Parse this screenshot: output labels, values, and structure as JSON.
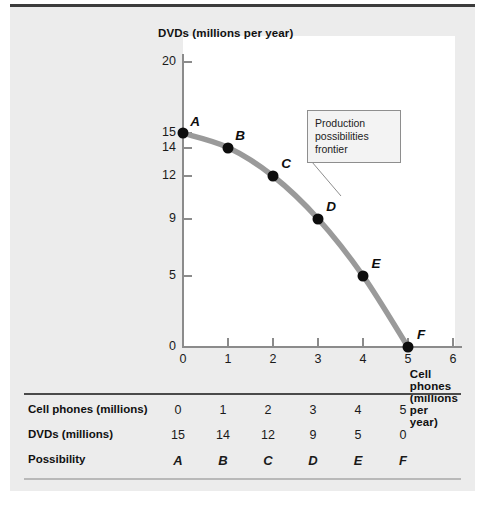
{
  "figure": {
    "plot_bg": "#ffffff",
    "panel_bg": "#ececec",
    "curve_color": "#9a9a9a",
    "point_color": "#0d0d0d",
    "axis_color": "#8b8b8b"
  },
  "callout": {
    "line1": "Production",
    "line2": "possibilities",
    "line3": "frontier"
  },
  "chart_data": {
    "type": "line",
    "title": "",
    "xlabel": "Cell phones (millions per year)",
    "ylabel": "DVDs (millions per year)",
    "xlim": [
      0,
      6
    ],
    "ylim": [
      0,
      20
    ],
    "xticks": [
      "0",
      "1",
      "2",
      "3",
      "4",
      "5",
      "6"
    ],
    "xtick_values": [
      0,
      1,
      2,
      3,
      4,
      5,
      6
    ],
    "yticks": [
      "0",
      "5",
      "9",
      "12",
      "14",
      "15",
      "20"
    ],
    "ytick_values": [
      0,
      5,
      9,
      12,
      14,
      15,
      20
    ],
    "grid": false,
    "legend": "none",
    "annotation": "Production possibilities frontier",
    "x": [
      0,
      1,
      2,
      3,
      4,
      5
    ],
    "values": [
      15,
      14,
      12,
      9,
      5,
      0
    ],
    "point_labels": [
      "A",
      "B",
      "C",
      "D",
      "E",
      "F"
    ],
    "series": [
      {
        "name": "Production possibilities frontier",
        "x": [
          0,
          1,
          2,
          3,
          4,
          5
        ],
        "values": [
          15,
          14,
          12,
          9,
          5,
          0
        ]
      }
    ]
  },
  "table": {
    "rows": [
      {
        "label": "Cell phones (millions)",
        "cells": [
          "0",
          "1",
          "2",
          "3",
          "4",
          "5"
        ]
      },
      {
        "label": "DVDs (millions)",
        "cells": [
          "15",
          "14",
          "12",
          "9",
          "5",
          "0"
        ]
      },
      {
        "label": "Possibility",
        "cells": [
          "A",
          "B",
          "C",
          "D",
          "E",
          "F"
        ]
      }
    ]
  }
}
